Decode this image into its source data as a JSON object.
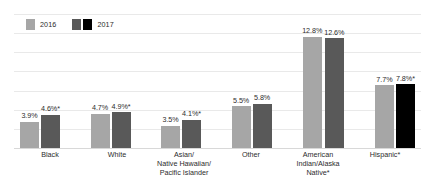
{
  "chart_data": {
    "type": "bar",
    "title": "",
    "subtitle": "",
    "xlabel": "",
    "ylabel": "",
    "ylim": [
      0,
      14
    ],
    "grid": true,
    "gridline_values": [
      2,
      4,
      6,
      8,
      10,
      12,
      14
    ],
    "legend_position": "top-left",
    "categories": [
      "Black",
      "White",
      "Asian/ Native Hawaiian/ Pacific Islander",
      "Other",
      "American Indian/Alaska Native*",
      "Hispanic*"
    ],
    "series": [
      {
        "name": "2016",
        "color": "#a6a6a6",
        "values": [
          3.9,
          4.7,
          3.5,
          5.5,
          12.8,
          7.7
        ],
        "labels": [
          "3.9%",
          "4.7%",
          "3.5%",
          "5.5%",
          "12.8%",
          "7.7%"
        ]
      },
      {
        "name": "2017",
        "color": "#595959",
        "values": [
          4.6,
          4.9,
          4.1,
          5.8,
          12.6,
          7.8
        ],
        "labels": [
          "4.6%*",
          "4.9%*",
          "4.1%*",
          "5.8%",
          "12.6%",
          "7.8%*"
        ],
        "point_colors": [
          "#595959",
          "#595959",
          "#595959",
          "#595959",
          "#595959",
          "#000000"
        ]
      }
    ]
  },
  "legend": {
    "entries": [
      {
        "label": "2016",
        "swatches": [
          "#a6a6a6"
        ]
      },
      {
        "label": "2017",
        "swatches": [
          "#595959",
          "#000000"
        ]
      }
    ]
  },
  "groups": [
    {
      "label_lines": [
        "Black"
      ],
      "bars": [
        {
          "value_label": "3.9%",
          "height_pct": 27.9,
          "color": "#a6a6a6",
          "series": "2016"
        },
        {
          "value_label": "4.6%*",
          "height_pct": 32.9,
          "color": "#595959",
          "series": "2017"
        }
      ]
    },
    {
      "label_lines": [
        "White"
      ],
      "bars": [
        {
          "value_label": "4.7%",
          "height_pct": 33.6,
          "color": "#a6a6a6",
          "series": "2016"
        },
        {
          "value_label": "4.9%*",
          "height_pct": 35.0,
          "color": "#595959",
          "series": "2017"
        }
      ]
    },
    {
      "label_lines": [
        "Asian/",
        "Native Hawaiian/",
        "Pacific Islander"
      ],
      "bars": [
        {
          "value_label": "3.5%",
          "height_pct": 25.0,
          "color": "#a6a6a6",
          "series": "2016"
        },
        {
          "value_label": "4.1%*",
          "height_pct": 29.3,
          "color": "#595959",
          "series": "2017"
        }
      ]
    },
    {
      "label_lines": [
        "Other"
      ],
      "bars": [
        {
          "value_label": "5.5%",
          "height_pct": 39.3,
          "color": "#a6a6a6",
          "series": "2016"
        },
        {
          "value_label": "5.8%",
          "height_pct": 41.4,
          "color": "#595959",
          "series": "2017"
        }
      ]
    },
    {
      "label_lines": [
        "American",
        "Indian/Alaska",
        "Native*"
      ],
      "bars": [
        {
          "value_label": "12.8%",
          "height_pct": 91.4,
          "color": "#a6a6a6",
          "series": "2016"
        },
        {
          "value_label": "12.6%",
          "height_pct": 90.0,
          "color": "#595959",
          "series": "2017"
        }
      ]
    },
    {
      "label_lines": [
        "Hispanic*"
      ],
      "bars": [
        {
          "value_label": "7.7%",
          "height_pct": 55.0,
          "color": "#a6a6a6",
          "series": "2016"
        },
        {
          "value_label": "7.8%*",
          "height_pct": 55.7,
          "color": "#000000",
          "series": "2017"
        }
      ]
    }
  ],
  "gridlines": [
    {
      "top_pct": 0
    },
    {
      "top_pct": 14.3
    },
    {
      "top_pct": 28.6
    },
    {
      "top_pct": 42.9
    },
    {
      "top_pct": 57.1
    },
    {
      "top_pct": 71.4
    },
    {
      "top_pct": 85.7
    },
    {
      "top_pct": 100
    }
  ]
}
